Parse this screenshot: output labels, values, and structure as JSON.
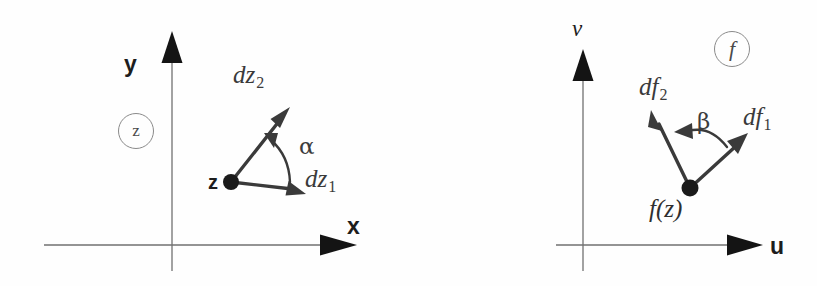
{
  "figure": {
    "background_color": "#fefefe",
    "axis_color": "#6e6e6e",
    "vector_color": "#3a3a3a",
    "label_color": "#2b2b2b",
    "tag_border_color": "#8a8a8a"
  },
  "panels": [
    {
      "id": "z-plane",
      "tag": "z",
      "axes": {
        "x_label": "x",
        "y_label": "y"
      },
      "origin_point": {
        "label": "z",
        "x": 231,
        "y": 182
      },
      "vectors": [
        {
          "name": "dz1",
          "label": "dz",
          "subscript": "1",
          "tip_x": 302,
          "tip_y": 193
        },
        {
          "name": "dz2",
          "label": "dz",
          "subscript": "2",
          "tip_x": 286,
          "tip_y": 112
        }
      ],
      "angle": {
        "symbol": "α",
        "name": "alpha",
        "from_vector": "dz1",
        "to_vector": "dz2"
      }
    },
    {
      "id": "f-plane",
      "tag": "f",
      "axes": {
        "x_label": "u",
        "y_label": "v"
      },
      "origin_point": {
        "label": "f(z)",
        "x": 690,
        "y": 188
      },
      "vectors": [
        {
          "name": "df1",
          "label": "df",
          "subscript": "1",
          "tip_x": 744,
          "tip_y": 137
        },
        {
          "name": "df2",
          "label": "df",
          "subscript": "2",
          "tip_x": 652,
          "tip_y": 114
        }
      ],
      "angle": {
        "symbol": "β",
        "name": "beta",
        "from_vector": "df1",
        "to_vector": "df2"
      }
    }
  ],
  "labels": {
    "left": {
      "y_axis": "y",
      "x_axis": "x",
      "tag": "z",
      "point": "z",
      "vec1": "dz",
      "vec1_sub": "1",
      "vec2": "dz",
      "vec2_sub": "2",
      "angle": "α"
    },
    "right": {
      "y_axis": "v",
      "x_axis": "u",
      "tag": "f",
      "point": "f(z)",
      "vec1": "df",
      "vec1_sub": "1",
      "vec2": "df",
      "vec2_sub": "2",
      "angle": "β"
    }
  }
}
